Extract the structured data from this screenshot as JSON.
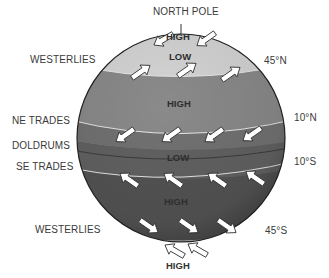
{
  "diagram": {
    "pole_label": "NORTH POLE",
    "left_labels": [
      {
        "id": "westerlies-north",
        "text": "WESTERLIES"
      },
      {
        "id": "ne-trades",
        "text": "NE TRADES"
      },
      {
        "id": "doldrums",
        "text": "DOLDRUMS"
      },
      {
        "id": "se-trades",
        "text": "SE TRADES"
      },
      {
        "id": "westerlies-south",
        "text": "WESTERLIES"
      }
    ],
    "latitude_labels": [
      {
        "id": "lat-45n",
        "text": "45°N"
      },
      {
        "id": "lat-10n",
        "text": "10°N"
      },
      {
        "id": "lat-10s",
        "text": "10°S"
      },
      {
        "id": "lat-45s",
        "text": "45°S"
      }
    ],
    "pressure_labels": [
      {
        "id": "polar-high-north",
        "text": "HIGH"
      },
      {
        "id": "subpolar-low-north",
        "text": "LOW"
      },
      {
        "id": "subtropical-high-north",
        "text": "HIGH"
      },
      {
        "id": "equatorial-low",
        "text": "LOW"
      },
      {
        "id": "subtropical-high-south",
        "text": "HIGH"
      },
      {
        "id": "polar-high-south",
        "text": "HIGH"
      }
    ],
    "colors": {
      "polar_cap": "#d6d6d6",
      "subtropical_band": "#8a8a8a",
      "trades_band": "#6e6e6e",
      "doldrums_band": "#5f5f5f",
      "southern_band": "#545454",
      "south_cap": "#3a3a3a",
      "arrow_fill": "#ffffff",
      "latitude_line": "#e8e8e8"
    }
  }
}
